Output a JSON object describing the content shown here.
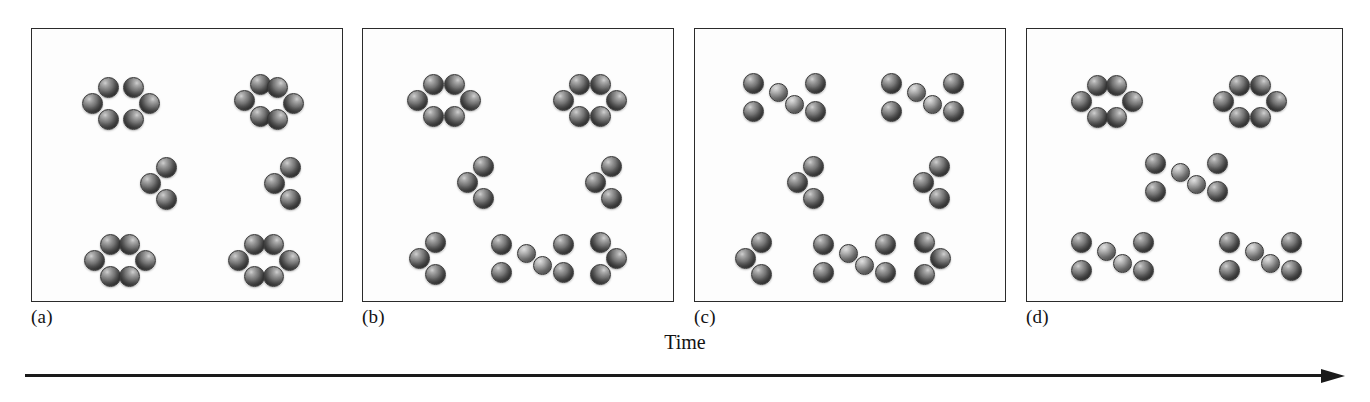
{
  "figure": {
    "axis": {
      "label": "Time",
      "direction": "left-to-right",
      "arrow_icon": "arrow-right-icon"
    },
    "atom_style": {
      "reactant_color": "#6e6e6e",
      "bridge_color": "#a5a5a5",
      "outline_color": "#333333"
    },
    "panel_style": {
      "background": "#fdfdfd",
      "border_color": "#2b2b2b"
    }
  },
  "chart_data": {
    "type": "diagram",
    "xlabel": "Time",
    "ylabel": "",
    "legend": [
      "trimer (reactant)",
      "dimer adduct (product)"
    ],
    "categories": [
      "(a)",
      "(b)",
      "(c)",
      "(d)"
    ],
    "series": [
      {
        "name": "trimer (reactant)",
        "values": [
          10,
          8,
          4,
          4
        ]
      },
      {
        "name": "dimer adduct (product)",
        "values": [
          0,
          1,
          3,
          3
        ]
      }
    ],
    "annotations": [
      "Reactant trimers progressively combine into bowtie-shaped dimer adducts as time advances from (a) to (d)."
    ]
  },
  "panels": [
    {
      "id": "panel-a",
      "label": "(a)",
      "left": 31,
      "width": 312,
      "trimer_count": 10,
      "dimer_count": 0,
      "molecules": [
        {
          "kind": "trimer",
          "variant": "right",
          "x": 50,
          "y": 48
        },
        {
          "kind": "trimer",
          "variant": "left",
          "x": 128,
          "y": 48
        },
        {
          "kind": "trimer",
          "variant": "right",
          "x": 202,
          "y": 45
        },
        {
          "kind": "trimer",
          "variant": "left",
          "x": 272,
          "y": 48
        },
        {
          "kind": "trimer",
          "variant": "right",
          "x": 108,
          "y": 128
        },
        {
          "kind": "trimer",
          "variant": "right",
          "x": 232,
          "y": 128
        },
        {
          "kind": "trimer",
          "variant": "right",
          "x": 52,
          "y": 205
        },
        {
          "kind": "trimer",
          "variant": "left",
          "x": 124,
          "y": 205
        },
        {
          "kind": "trimer",
          "variant": "right",
          "x": 196,
          "y": 205
        },
        {
          "kind": "trimer",
          "variant": "left",
          "x": 268,
          "y": 205
        }
      ]
    },
    {
      "id": "panel-b",
      "label": "(b)",
      "left": 362,
      "width": 312,
      "trimer_count": 8,
      "dimer_count": 1,
      "molecules": [
        {
          "kind": "trimer",
          "variant": "right",
          "x": 44,
          "y": 45
        },
        {
          "kind": "trimer",
          "variant": "left",
          "x": 118,
          "y": 45
        },
        {
          "kind": "trimer",
          "variant": "right",
          "x": 190,
          "y": 45
        },
        {
          "kind": "trimer",
          "variant": "left",
          "x": 264,
          "y": 45
        },
        {
          "kind": "trimer",
          "variant": "right",
          "x": 94,
          "y": 127
        },
        {
          "kind": "trimer",
          "variant": "right",
          "x": 222,
          "y": 127
        },
        {
          "kind": "trimer",
          "variant": "right",
          "x": 46,
          "y": 203
        },
        {
          "kind": "dimer",
          "variant": "x",
          "x": 128,
          "y": 205
        },
        {
          "kind": "trimer",
          "variant": "left",
          "x": 264,
          "y": 203
        }
      ]
    },
    {
      "id": "panel-c",
      "label": "(c)",
      "left": 694,
      "width": 312,
      "trimer_count": 4,
      "dimer_count": 3,
      "molecules": [
        {
          "kind": "dimer",
          "variant": "x",
          "x": 48,
          "y": 44
        },
        {
          "kind": "dimer",
          "variant": "x",
          "x": 186,
          "y": 44
        },
        {
          "kind": "trimer",
          "variant": "right",
          "x": 92,
          "y": 127
        },
        {
          "kind": "trimer",
          "variant": "right",
          "x": 218,
          "y": 127
        },
        {
          "kind": "trimer",
          "variant": "right",
          "x": 40,
          "y": 203
        },
        {
          "kind": "dimer",
          "variant": "x",
          "x": 118,
          "y": 205
        },
        {
          "kind": "trimer",
          "variant": "left",
          "x": 256,
          "y": 203
        }
      ]
    },
    {
      "id": "panel-d",
      "label": "(d)",
      "left": 1026,
      "width": 317,
      "trimer_count": 4,
      "dimer_count": 3,
      "molecules": [
        {
          "kind": "trimer",
          "variant": "right",
          "x": 44,
          "y": 46
        },
        {
          "kind": "trimer",
          "variant": "left",
          "x": 116,
          "y": 46
        },
        {
          "kind": "trimer",
          "variant": "right",
          "x": 186,
          "y": 46
        },
        {
          "kind": "trimer",
          "variant": "left",
          "x": 260,
          "y": 46
        },
        {
          "kind": "dimer",
          "variant": "x",
          "x": 118,
          "y": 124
        },
        {
          "kind": "dimer",
          "variant": "x",
          "x": 44,
          "y": 203
        },
        {
          "kind": "dimer",
          "variant": "x",
          "x": 192,
          "y": 203
        }
      ]
    }
  ]
}
